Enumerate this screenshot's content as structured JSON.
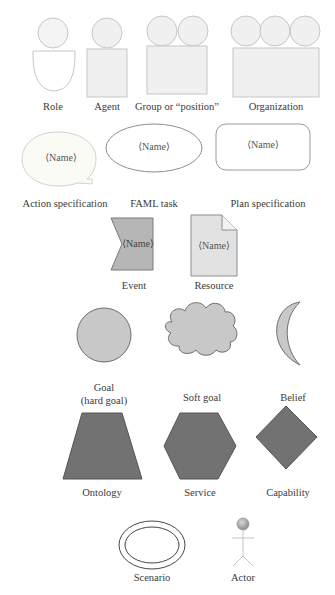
{
  "diagram": {
    "kind": "notation legend",
    "colors": {
      "light_fill": "#efefef",
      "light_stroke": "#c4c4c4",
      "medium_fill": "#cfcfcf",
      "medium_stroke": "#7a7a7a",
      "dark_fill": "#757575",
      "dark_stroke": "#555555"
    },
    "placeholder_text": "⟨Name⟩",
    "rows": [
      {
        "shapes": [
          {
            "id": "role",
            "label": "Role"
          },
          {
            "id": "agent",
            "label": "Agent"
          },
          {
            "id": "group",
            "label": "Group or “position”"
          },
          {
            "id": "organization",
            "label": "Organization"
          }
        ]
      },
      {
        "shapes": [
          {
            "id": "action-spec",
            "label": "Action specification",
            "text": "⟨Name⟩"
          },
          {
            "id": "faml-task",
            "label": "FAML task",
            "text": "⟨Name⟩"
          },
          {
            "id": "plan-spec",
            "label": "Plan specification",
            "text": "⟨Name⟩"
          }
        ]
      },
      {
        "shapes": [
          {
            "id": "event",
            "label": "Event",
            "text": "⟨Name⟩"
          },
          {
            "id": "resource",
            "label": "Resource",
            "text": "⟨Name⟩"
          }
        ]
      },
      {
        "shapes": [
          {
            "id": "goal",
            "label": "Goal",
            "label2": "(hard goal)"
          },
          {
            "id": "soft-goal",
            "label": "Soft goal"
          },
          {
            "id": "belief",
            "label": "Belief"
          }
        ]
      },
      {
        "shapes": [
          {
            "id": "ontology",
            "label": "Ontology"
          },
          {
            "id": "service",
            "label": "Service"
          },
          {
            "id": "capability",
            "label": "Capability"
          }
        ]
      },
      {
        "shapes": [
          {
            "id": "scenario",
            "label": "Scenario"
          },
          {
            "id": "actor",
            "label": "Actor"
          }
        ]
      }
    ]
  }
}
